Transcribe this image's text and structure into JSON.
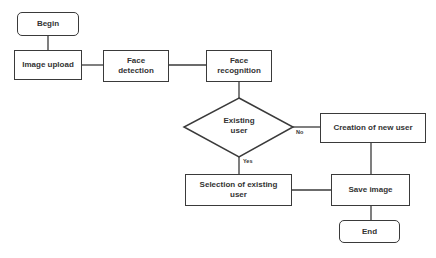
{
  "diagram": {
    "type": "flowchart",
    "nodes": {
      "begin": {
        "label": "Begin",
        "shape": "terminator"
      },
      "image_upload": {
        "label": "Image upload",
        "shape": "process"
      },
      "face_detection": {
        "label": "Face\ndetection",
        "shape": "process"
      },
      "face_recognition": {
        "label": "Face\nrecognition",
        "shape": "process"
      },
      "existing_user": {
        "label": "Existing\nuser",
        "shape": "decision"
      },
      "creation_new_user": {
        "label": "Creation of new user",
        "shape": "process"
      },
      "selection_existing_user": {
        "label": "Selection of existing\nuser",
        "shape": "process"
      },
      "save_image": {
        "label": "Save image",
        "shape": "process"
      },
      "end": {
        "label": "End",
        "shape": "terminator"
      }
    },
    "edges": [
      {
        "from": "begin",
        "to": "image_upload",
        "label": ""
      },
      {
        "from": "image_upload",
        "to": "face_detection",
        "label": ""
      },
      {
        "from": "face_detection",
        "to": "face_recognition",
        "label": ""
      },
      {
        "from": "face_recognition",
        "to": "existing_user",
        "label": ""
      },
      {
        "from": "existing_user",
        "to": "creation_new_user",
        "label": "No"
      },
      {
        "from": "existing_user",
        "to": "selection_existing_user",
        "label": "Yes"
      },
      {
        "from": "creation_new_user",
        "to": "save_image",
        "label": ""
      },
      {
        "from": "selection_existing_user",
        "to": "save_image",
        "label": ""
      },
      {
        "from": "save_image",
        "to": "end",
        "label": ""
      }
    ],
    "edge_labels": {
      "no": "No",
      "yes": "Yes"
    }
  }
}
